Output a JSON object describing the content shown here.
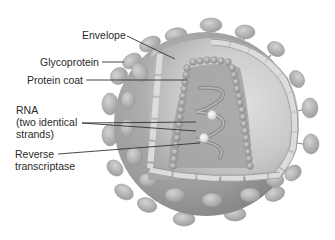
{
  "figure": {
    "labels": [
      {
        "id": "envelope",
        "text": "Envelope"
      },
      {
        "id": "glycoprotein",
        "text": "Glycoprotein"
      },
      {
        "id": "protein_coat",
        "text": "Protein coat"
      },
      {
        "id": "rna",
        "lines": [
          "RNA",
          "(two identical",
          "strands)"
        ]
      },
      {
        "id": "reverse_transcriptase",
        "lines": [
          "Reverse",
          "transcriptase"
        ]
      }
    ]
  },
  "colors": {
    "background": "#ffffff",
    "shell_dark": "#8f8f8f",
    "shell_mid": "#a9a9a9",
    "interior": "#c8c8c8",
    "membrane_light": "#d8d8d8",
    "spike": "#b5b5b5",
    "text": "#2a2a2a",
    "leader_line": "#333333"
  }
}
